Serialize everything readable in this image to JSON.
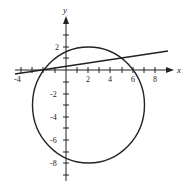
{
  "diagram": {
    "type": "coordinate-plot",
    "axes": {
      "x_label": "x",
      "y_label": "y"
    },
    "x_ticks": [
      "-4",
      "2",
      "4",
      "6",
      "8"
    ],
    "y_ticks": [
      "2",
      "-2",
      "-4",
      "-6",
      "-8"
    ],
    "shapes": [
      {
        "kind": "circle",
        "center": [
          2,
          -3
        ],
        "radius": 5
      },
      {
        "kind": "line",
        "from": [
          -4.5,
          -0.36
        ],
        "to": [
          9,
          1.57
        ],
        "passes_through": [
          [
            -2,
            0
          ],
          [
            5,
            1
          ]
        ]
      }
    ],
    "colors": {
      "ink": "#222222",
      "background": "#ffffff"
    }
  }
}
